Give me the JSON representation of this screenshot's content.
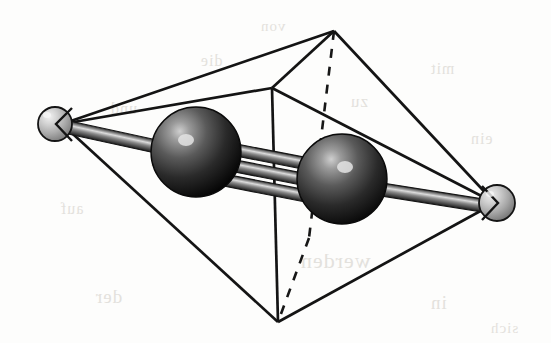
{
  "figure": {
    "background_color": "#fdfdfc",
    "line_color": "#1a1a1a",
    "atoms": [
      {
        "id": "ligand-left",
        "label": "small light sphere (left apex)",
        "kind": "small",
        "cx": 55,
        "cy": 124,
        "r": 17,
        "fill_light": "#e8e8e8",
        "fill_mid": "#b3b3b3",
        "fill_dark": "#6e6e6e",
        "highlight_x": 46,
        "highlight_y": 114
      },
      {
        "id": "metal-left",
        "label": "large dark sphere (left metal center)",
        "kind": "large",
        "cx": 196,
        "cy": 152,
        "r": 45,
        "fill_light": "#8d8d8d",
        "fill_mid": "#3b3b3b",
        "fill_dark": "#0a0a0a",
        "highlight_x": 186,
        "highlight_y": 140
      },
      {
        "id": "metal-right",
        "label": "large dark sphere (right metal center)",
        "kind": "large",
        "cx": 342,
        "cy": 179,
        "r": 45,
        "fill_light": "#8d8d8d",
        "fill_mid": "#3b3b3b",
        "fill_dark": "#0a0a0a",
        "highlight_x": 345,
        "highlight_y": 167
      },
      {
        "id": "ligand-right",
        "label": "small light sphere (right apex)",
        "kind": "small",
        "cx": 497,
        "cy": 203,
        "r": 18,
        "fill_light": "#e6e6e6",
        "fill_mid": "#aeaeae",
        "fill_dark": "#6a6a6a",
        "highlight_x": 490,
        "highlight_y": 193
      }
    ],
    "bonds": {
      "multiplicity": 3,
      "label": "triple bond rods between the two metal spheres",
      "rods": [
        {
          "x1": 228,
          "y1": 148,
          "x2": 312,
          "y2": 164
        },
        {
          "x1": 227,
          "y1": 163,
          "x2": 310,
          "y2": 180
        },
        {
          "x1": 226,
          "y1": 179,
          "x2": 309,
          "y2": 196
        }
      ],
      "axial_rods": [
        {
          "x1": 62,
          "y1": 126,
          "x2": 158,
          "y2": 147
        },
        {
          "x1": 382,
          "y1": 188,
          "x2": 489,
          "y2": 205
        }
      ]
    },
    "polyhedron": {
      "label": "octahedron / bipyramid wireframe cage",
      "vertices": {
        "apex_top": {
          "x": 334,
          "y": 31
        },
        "apex_bottom": {
          "x": 278,
          "y": 322
        },
        "left": {
          "x": 62,
          "y": 124
        },
        "right": {
          "x": 495,
          "y": 203
        },
        "front": {
          "x": 272,
          "y": 88
        },
        "back": {
          "x": 309,
          "y": 238
        }
      },
      "solid_edges": [
        {
          "from": "left",
          "to": "apex_top"
        },
        {
          "from": "left",
          "to": "front"
        },
        {
          "from": "left",
          "to": "apex_bottom"
        },
        {
          "from": "front",
          "to": "apex_top"
        },
        {
          "from": "front",
          "to": "right"
        },
        {
          "from": "front",
          "to": "apex_bottom"
        },
        {
          "from": "apex_top",
          "to": "right"
        },
        {
          "from": "apex_bottom",
          "to": "right"
        }
      ],
      "hidden_edges": [
        {
          "from": "apex_top",
          "to": "back"
        },
        {
          "from": "back",
          "to": "apex_bottom"
        }
      ]
    },
    "ghost_text": {
      "note": "faint show-through text from the reverse side of the scanned page",
      "lines": [
        {
          "text": "werden",
          "x": 300,
          "y": 248,
          "size": 22
        },
        {
          "text": "der",
          "x": 95,
          "y": 286,
          "size": 19
        },
        {
          "text": "in",
          "x": 430,
          "y": 292,
          "size": 19
        },
        {
          "text": "Ba",
          "x": 150,
          "y": 148,
          "size": 20
        },
        {
          "text": "zu",
          "x": 350,
          "y": 92,
          "size": 17
        },
        {
          "text": "die",
          "x": 200,
          "y": 52,
          "size": 16
        },
        {
          "text": "mit",
          "x": 430,
          "y": 60,
          "size": 16
        },
        {
          "text": "und",
          "x": 110,
          "y": 100,
          "size": 16
        },
        {
          "text": "ein",
          "x": 470,
          "y": 130,
          "size": 16
        },
        {
          "text": "auf",
          "x": 60,
          "y": 200,
          "size": 16
        },
        {
          "text": "von",
          "x": 260,
          "y": 18,
          "size": 15
        },
        {
          "text": "sich",
          "x": 490,
          "y": 320,
          "size": 15
        }
      ]
    }
  }
}
